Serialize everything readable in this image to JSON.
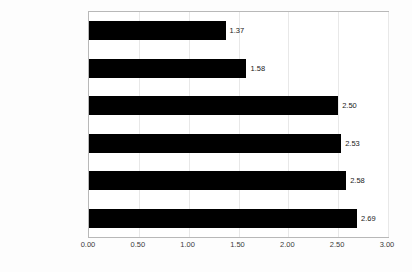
{
  "chart_data": {
    "type": "bar",
    "orientation": "horizontal",
    "title": "",
    "subtitle": "",
    "xlabel": "",
    "ylabel": "",
    "xlim": [
      0,
      3.0
    ],
    "xticks": [
      "0.00",
      "0.50",
      "1.00",
      "1.50",
      "2.00",
      "2.50",
      "3.00"
    ],
    "xtick_values": [
      0,
      0.5,
      1.0,
      1.5,
      2.0,
      2.5,
      3.0
    ],
    "grid": true,
    "legend": false,
    "bar_color": "#000000",
    "categories": [
      "Zufriedenheit der\nMitarbeiter",
      "Identifikation mit dem\nUnternehmen",
      "andere",
      "Transparenz",
      "Verminderung von\nKonflikten",
      "Erhöhung des\nArbeitsmarktwertes"
    ],
    "values": [
      1.37,
      1.58,
      2.5,
      2.53,
      2.58,
      2.69
    ],
    "value_labels": [
      "1.37",
      "1.58",
      "2.50",
      "2.53",
      "2.58",
      "2.69"
    ]
  },
  "colors": {
    "bar": "#000000",
    "plot_border": "#b8b8b8",
    "gridline": "#e8e8e8",
    "background": "#fdfdfd",
    "text": "#3a3a3a"
  }
}
